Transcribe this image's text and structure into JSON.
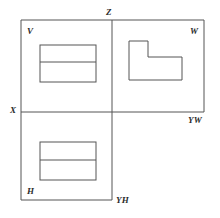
{
  "figure": {
    "kind": "orthographic-projection-axes-diagram",
    "stroke_color": "#555555",
    "background_color": "#ffffff",
    "labels": {
      "z": "Z",
      "v": "V",
      "w": "W",
      "x": "X",
      "yw": "YW",
      "h": "H",
      "yh": "YH"
    }
  },
  "geometry": {
    "frame": {
      "left": 21,
      "top": 20,
      "right": 204,
      "bottom": 200,
      "mid_x": 112,
      "mid_y": 112
    },
    "quadrants": {
      "v_plane": {
        "x": 21,
        "y": 20,
        "w": 91,
        "h": 92
      },
      "w_plane": {
        "x": 112,
        "y": 20,
        "w": 92,
        "h": 92
      },
      "h_plane": {
        "x": 21,
        "y": 112,
        "w": 91,
        "h": 88
      }
    },
    "v_view_rect": {
      "x": 40,
      "y": 45,
      "w": 56,
      "h": 37,
      "divider_y": 62
    },
    "h_view_rect": {
      "x": 40,
      "y": 142,
      "w": 56,
      "h": 38,
      "divider_y": 160
    },
    "w_view_lshape": {
      "points": "129,41 148,41 148,57 182,57 182,80 129,80"
    }
  }
}
